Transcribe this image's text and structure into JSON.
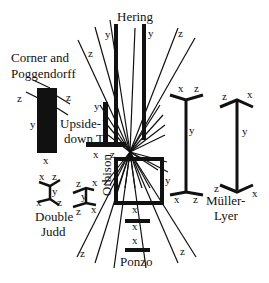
{
  "figure": {
    "background": "#ffffff",
    "ink": "#111111"
  },
  "illusions": {
    "hering": {
      "title": "Hering",
      "labels": [
        "y",
        "y",
        "z",
        "z"
      ]
    },
    "corner_poggendorff": {
      "title_line1": "Corner and",
      "title_line2": "Poggendorff",
      "labels": [
        "z",
        "z",
        "y",
        "x"
      ]
    },
    "upside_down_t": {
      "title_line1": "Upside-",
      "title_line2": "down T",
      "labels": [
        "y",
        "x",
        "z"
      ]
    },
    "orbison": {
      "title": "Orbison",
      "labels": [
        "y"
      ]
    },
    "double_judd": {
      "title_line1": "Double",
      "title_line2": "Judd",
      "labels_left": [
        "x",
        "z",
        "y",
        "x",
        "z"
      ],
      "labels_right": [
        "z",
        "x",
        "y",
        "z",
        "x"
      ]
    },
    "ponzo": {
      "title": "Ponzo",
      "labels": [
        "x",
        "x",
        "x",
        "z",
        "z"
      ]
    },
    "muller_lyer": {
      "title_line1": "Müller-",
      "title_line2": "Lyer",
      "labels_left": [
        "x",
        "z",
        "y",
        "x",
        "z"
      ],
      "labels_right": [
        "z",
        "x",
        "y",
        "z",
        "x"
      ]
    }
  }
}
